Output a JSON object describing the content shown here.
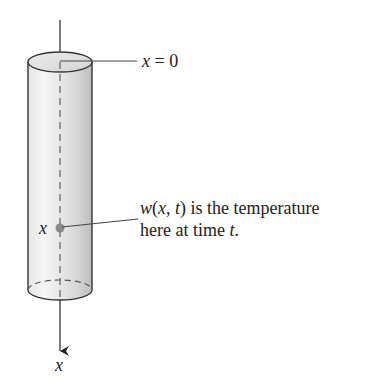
{
  "diagram": {
    "top_label_var": "x",
    "top_label_eq": " = 0",
    "point_label": "x",
    "axis_label": "x",
    "annotation": {
      "line1_w": "w",
      "line1_open": "(",
      "line1_x": "x",
      "line1_comma": ", ",
      "line1_t": "t",
      "line1_rest": ") is the temperature",
      "line2_pre": "here at time ",
      "line2_t": "t",
      "line2_end": "."
    },
    "colors": {
      "outline": "#333333",
      "shading_light": "#f4f4f4",
      "shading_dark": "#c8c8c8",
      "dot": "#8a8a8a"
    }
  }
}
